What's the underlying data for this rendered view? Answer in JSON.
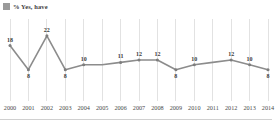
{
  "legend": {
    "swatch_icon": "legend-swatch-icon",
    "label": "% Yes, have",
    "color": "#9a9a9a"
  },
  "chart_data": {
    "type": "line",
    "title": "",
    "subtitle": "",
    "xlabel": "",
    "ylabel": "",
    "grid": "vertical",
    "legend_position": "top-left",
    "line_color": "#8c8c8c",
    "ylim": [
      0,
      24
    ],
    "categories": [
      "2000",
      "2001",
      "2002",
      "2003",
      "2004",
      "2005",
      "2006",
      "2007",
      "2008",
      "2009",
      "2010",
      "2011",
      "2012",
      "2013",
      "2014"
    ],
    "series": [
      {
        "name": "% Yes, have",
        "values": [
          18,
          8,
          22,
          8,
          10,
          10,
          11,
          12,
          12,
          8,
          10,
          11,
          12,
          10,
          8
        ],
        "labels": [
          "18",
          "8",
          "22",
          "8",
          "10",
          "",
          "11",
          "12",
          "12",
          "8",
          "10",
          "",
          "12",
          "10",
          "8"
        ],
        "label_positions": [
          "above",
          "below",
          "above",
          "below",
          "above",
          "",
          "above",
          "above",
          "above",
          "below",
          "above",
          "",
          "above",
          "above",
          "below"
        ]
      }
    ]
  }
}
